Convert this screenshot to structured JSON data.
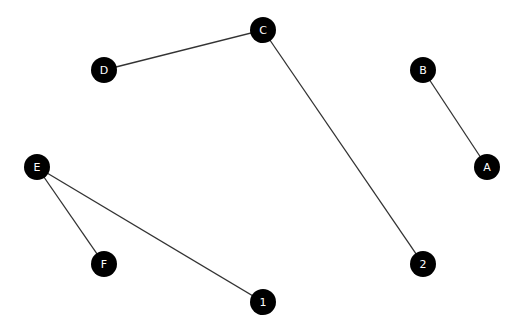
{
  "graph": {
    "nodes": [
      {
        "id": "C",
        "label": "C",
        "x": 263,
        "y": 30
      },
      {
        "id": "D",
        "label": "D",
        "x": 104,
        "y": 70
      },
      {
        "id": "B",
        "label": "B",
        "x": 423,
        "y": 70
      },
      {
        "id": "A",
        "label": "A",
        "x": 487,
        "y": 167
      },
      {
        "id": "E",
        "label": "E",
        "x": 37,
        "y": 167
      },
      {
        "id": "F",
        "label": "F",
        "x": 104,
        "y": 264
      },
      {
        "id": "2",
        "label": "2",
        "x": 423,
        "y": 264
      },
      {
        "id": "1",
        "label": "1",
        "x": 263,
        "y": 302
      }
    ],
    "edges": [
      {
        "from": "D",
        "to": "C"
      },
      {
        "from": "C",
        "to": "2"
      },
      {
        "from": "B",
        "to": "A"
      },
      {
        "from": "E",
        "to": "F"
      },
      {
        "from": "E",
        "to": "1"
      }
    ],
    "node_radius": 13,
    "node_color": "#000000",
    "label_color": "#ffffff",
    "edge_color": "#333333"
  }
}
